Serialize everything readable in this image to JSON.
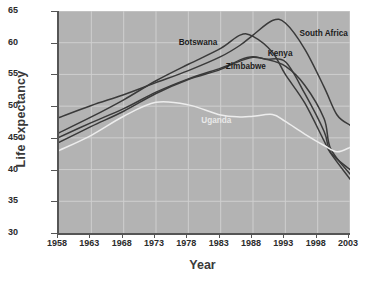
{
  "chart_data": {
    "type": "line",
    "title": "",
    "xlabel": "Year",
    "ylabel": "Life expectancy",
    "xlim": [
      1958,
      2003
    ],
    "ylim": [
      30,
      65
    ],
    "xticks": [
      1958,
      1963,
      1968,
      1973,
      1978,
      1983,
      1988,
      1993,
      1998,
      2003
    ],
    "yticks": [
      30,
      35,
      40,
      45,
      50,
      55,
      60,
      65
    ],
    "grid": true,
    "legend_position": "inline-labels",
    "annotation": "Source: World Bank, World Development Indicators, 2004",
    "series": [
      {
        "name": "South Africa",
        "color": "#3a3a3a",
        "label_x": 1995.2,
        "label_y": 61.4,
        "x": [
          1958,
          1963,
          1968,
          1973,
          1978,
          1983,
          1986,
          1988,
          1991,
          1993,
          1996,
          1999,
          2001,
          2003
        ],
        "y": [
          48.2,
          50.1,
          51.8,
          53.7,
          55.6,
          57.8,
          59.6,
          61.2,
          63.5,
          63.1,
          59.0,
          53.0,
          48.6,
          47.0
        ]
      },
      {
        "name": "Botswana",
        "color": "#3a3a3a",
        "label_x": 1976.5,
        "label_y": 60.0,
        "x": [
          1958,
          1963,
          1968,
          1973,
          1978,
          1983,
          1986,
          1988,
          1991,
          1993,
          1996,
          1999,
          2000,
          2003
        ],
        "y": [
          45.8,
          48.3,
          51.0,
          54.0,
          56.6,
          59.1,
          61.2,
          61.0,
          58.5,
          55.0,
          50.5,
          44.5,
          42.6,
          38.5
        ]
      },
      {
        "name": "Kenya",
        "color": "#3a3a3a",
        "label_x": 1990.3,
        "label_y": 58.2,
        "x": [
          1958,
          1963,
          1968,
          1973,
          1978,
          1983,
          1986,
          1988,
          1990,
          1993,
          1996,
          1999,
          2000,
          2003
        ],
        "y": [
          45.1,
          47.4,
          49.6,
          52.2,
          54.3,
          56.0,
          57.1,
          57.7,
          57.4,
          56.3,
          53.3,
          48.0,
          43.3,
          39.3
        ]
      },
      {
        "name": "Zimbabwe",
        "color": "#3a3a3a",
        "label_x": 1983.8,
        "label_y": 56.1,
        "x": [
          1958,
          1963,
          1968,
          1973,
          1978,
          1983,
          1986,
          1988,
          1990,
          1993,
          1996,
          1999,
          2000,
          2003
        ],
        "y": [
          44.3,
          46.8,
          49.2,
          52.0,
          54.2,
          55.8,
          57.3,
          57.8,
          57.4,
          57.0,
          52.0,
          46.0,
          42.7,
          40.0
        ]
      },
      {
        "name": "Uganda",
        "color": "#ededed",
        "label_x": 1980.0,
        "label_y": 47.6,
        "x": [
          1958,
          1963,
          1968,
          1973,
          1978,
          1983,
          1986,
          1988,
          1991,
          1993,
          1996,
          1999,
          2001,
          2003
        ],
        "y": [
          43.0,
          45.4,
          48.4,
          50.6,
          50.2,
          48.6,
          48.3,
          48.4,
          48.7,
          47.6,
          45.6,
          43.8,
          42.8,
          43.5
        ]
      }
    ]
  }
}
